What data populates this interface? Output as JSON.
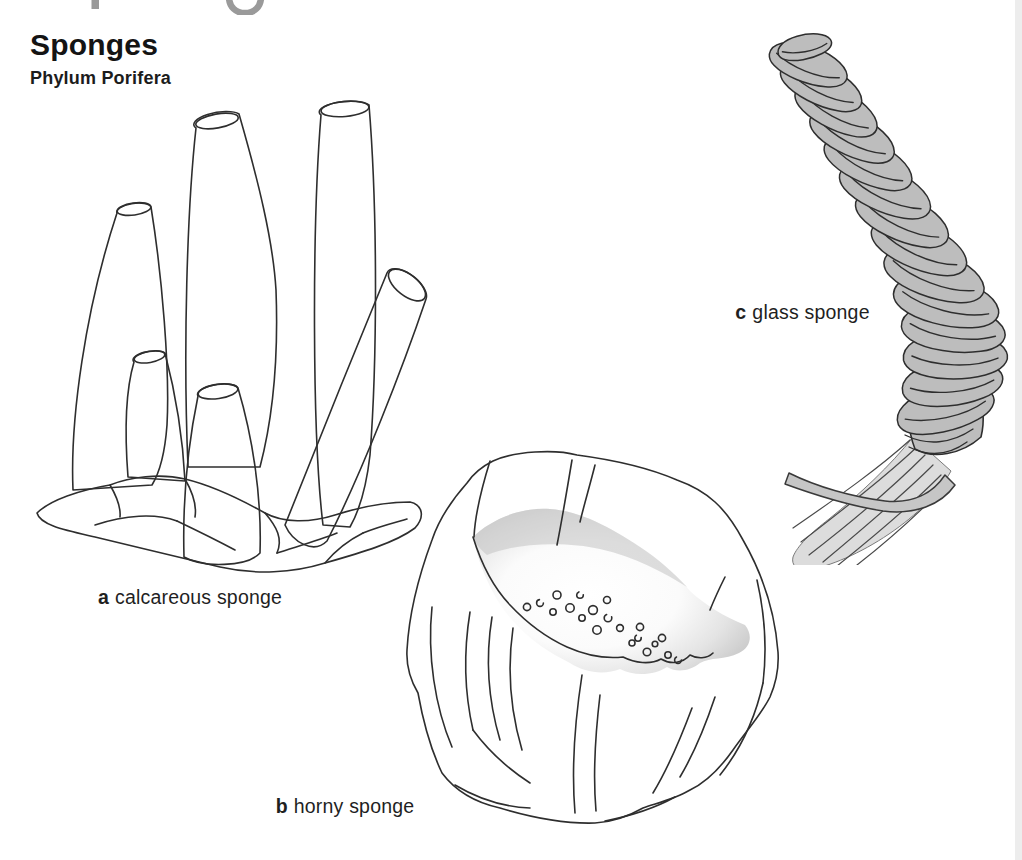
{
  "page": {
    "title": "Sponges",
    "subtitle": "Phylum Porifera"
  },
  "figures": [
    {
      "letter": "a",
      "label": "calcareous sponge"
    },
    {
      "letter": "b",
      "label": "horny sponge"
    },
    {
      "letter": "c",
      "label": "glass sponge"
    }
  ],
  "colors": {
    "ink": "#2e2e2e",
    "text": "#1f1f1f",
    "sponge-body-gray": "#cbcbcb",
    "rock-gray": "#b3b3b3",
    "glass-sponge-gray": "#bdbdbd",
    "root-tuft-gray": "#dcdcdc",
    "cropped-heading-gray": "#9a9a9a",
    "page-edge-gray": "#ededed",
    "background": "#ffffff"
  }
}
